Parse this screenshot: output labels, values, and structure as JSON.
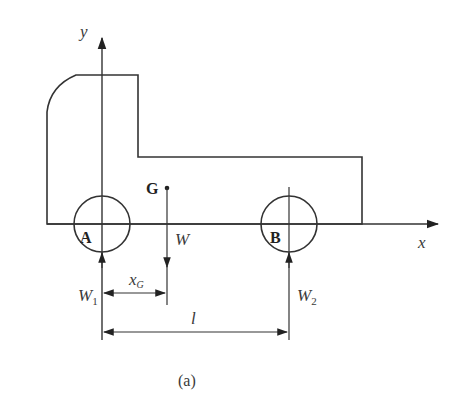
{
  "figure": {
    "caption": "(a)",
    "colors": {
      "stroke": "#333333",
      "text": "#3a3a3a",
      "background": "#ffffff"
    }
  },
  "axes": {
    "x_label": "x",
    "y_label": "y"
  },
  "points": {
    "center_of_gravity": "G",
    "front_wheel": "A",
    "rear_wheel": "B"
  },
  "forces": {
    "weight": "W",
    "reaction_front": {
      "main": "W",
      "sub": "1"
    },
    "reaction_rear": {
      "main": "W",
      "sub": "2"
    }
  },
  "dimensions": {
    "cg_distance": {
      "main": "x",
      "sub": "G"
    },
    "wheelbase": "l"
  }
}
